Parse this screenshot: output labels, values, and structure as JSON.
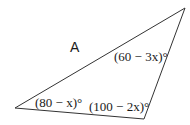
{
  "figure": {
    "type": "triangle",
    "region_label": "A",
    "vertices": {
      "top_right": {
        "x": 185,
        "y": 8
      },
      "left": {
        "x": 15,
        "y": 108
      },
      "bottom": {
        "x": 144,
        "y": 119
      }
    },
    "stroke_color": "#333333"
  },
  "angles": {
    "top_right": "(60 − 3x)°",
    "left": "(80 − x)°",
    "bottom": "(100 − 2x)°"
  }
}
